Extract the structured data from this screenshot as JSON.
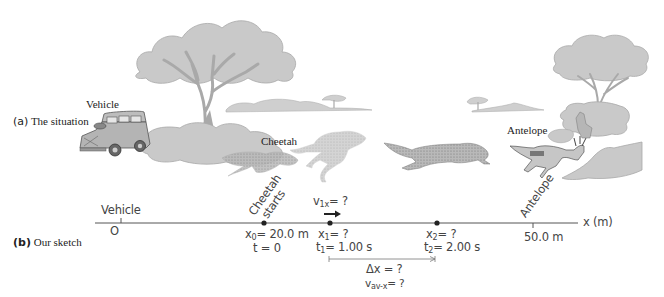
{
  "panel_a": {
    "letter": "(a)",
    "title": "The situation",
    "labels": {
      "vehicle": "Vehicle",
      "cheetah": "Cheetah",
      "antelope": "Antelope"
    },
    "illustrations": [
      "vehicle",
      "acacia-tree-large",
      "acacia-tree-small",
      "distant-tree",
      "bushes",
      "cheetah-crouching",
      "cheetah-leaping",
      "cheetah-running",
      "antelope-running",
      "rabbit"
    ]
  },
  "panel_b": {
    "letter": "(b)",
    "title": "Our sketch",
    "axis_label": "x (m)",
    "origin": {
      "label": "Vehicle",
      "value": "O"
    },
    "points": [
      {
        "name": "cheetah-start",
        "rot_label_1": "Cheetah",
        "rot_label_2": "starts",
        "x_label": "x",
        "x_sub": "0",
        "x_value": "= 20.0 m",
        "t_label": "t = 0"
      },
      {
        "name": "point-1",
        "x_label": "x",
        "x_sub": "1",
        "x_value": "= ?",
        "t_label": "t",
        "t_sub": "1",
        "t_value": "= 1.00 s"
      },
      {
        "name": "point-2",
        "x_label": "x",
        "x_sub": "2",
        "x_value": "= ?",
        "t_label": "t",
        "t_sub": "2",
        "t_value": "= 2.00 s"
      }
    ],
    "antelope": {
      "rot_label": "Antelope",
      "value": "50.0 m"
    },
    "velocity": {
      "v": "v",
      "sub": "1x",
      "rest": "= ?"
    },
    "interval": {
      "delta_x": "Δx = ?",
      "v_av": "v",
      "v_av_sub": "av-x",
      "v_av_rest": "= ?"
    }
  }
}
